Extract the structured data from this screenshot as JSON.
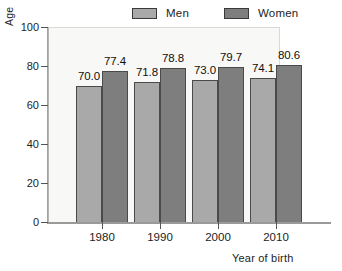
{
  "chart_data": {
    "type": "bar",
    "title": "",
    "subtitle": "",
    "xlabel": "Year of birth",
    "ylabel": "Age",
    "categories": [
      "1980",
      "1990",
      "2000",
      "2010"
    ],
    "series": [
      {
        "name": "Men",
        "values": [
          70.0,
          71.8,
          73.0,
          74.1
        ],
        "value_labels": [
          "70.0",
          "71.8",
          "73.0",
          "74.1"
        ],
        "color": "#a9a9a9"
      },
      {
        "name": "Women",
        "values": [
          77.4,
          78.8,
          79.7,
          80.6
        ],
        "value_labels": [
          "77.4",
          "78.8",
          "79.7",
          "80.6"
        ],
        "color": "#7e7e7e"
      }
    ],
    "ylim": [
      0,
      100
    ],
    "yticks": [
      0,
      20,
      40,
      60,
      80,
      100
    ],
    "ytick_labels": [
      "0",
      "20",
      "40",
      "60",
      "80",
      "100"
    ],
    "grid": false,
    "legend_position": "top",
    "plot_background": "#f8f8f6"
  },
  "legend": {
    "entries": [
      {
        "label": "Men",
        "color": "#a9a9a9"
      },
      {
        "label": "Women",
        "color": "#7e7e7e"
      }
    ]
  },
  "axes": {
    "y_title": "Age",
    "x_title": "Year of birth",
    "y_tick_labels": [
      "100",
      "80",
      "60",
      "40",
      "20",
      "0"
    ],
    "x_tick_labels": [
      "1980",
      "1990",
      "2000",
      "2010"
    ]
  }
}
